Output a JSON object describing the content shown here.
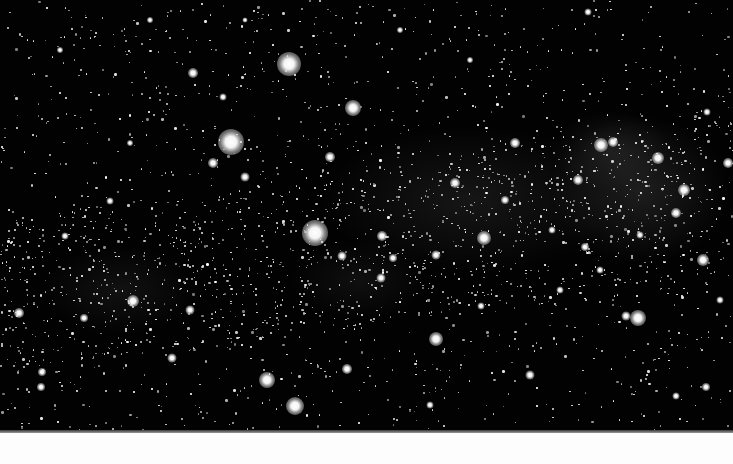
{
  "image": {
    "subject": "Milky Way starfield",
    "background_color": "#020202",
    "bottom_strip_color": "#fdfdfd"
  },
  "haze": [
    {
      "x": 470,
      "y": 200,
      "w": 300,
      "h": 150,
      "alpha": 0.1
    },
    {
      "x": 640,
      "y": 190,
      "w": 180,
      "h": 150,
      "alpha": 0.14
    },
    {
      "x": 610,
      "y": 150,
      "w": 120,
      "h": 80,
      "alpha": 0.1
    },
    {
      "x": 120,
      "y": 290,
      "w": 160,
      "h": 90,
      "alpha": 0.08
    },
    {
      "x": 360,
      "y": 280,
      "w": 140,
      "h": 80,
      "alpha": 0.07
    }
  ],
  "bright_stars": [
    {
      "x": 289,
      "y": 64,
      "r": 24
    },
    {
      "x": 231,
      "y": 142,
      "r": 26
    },
    {
      "x": 315,
      "y": 233,
      "r": 26
    },
    {
      "x": 353,
      "y": 108,
      "r": 16
    },
    {
      "x": 330,
      "y": 157,
      "r": 10
    },
    {
      "x": 193,
      "y": 73,
      "r": 10
    },
    {
      "x": 213,
      "y": 163,
      "r": 10
    },
    {
      "x": 245,
      "y": 177,
      "r": 9
    },
    {
      "x": 223,
      "y": 97,
      "r": 7
    },
    {
      "x": 267,
      "y": 380,
      "r": 16
    },
    {
      "x": 295,
      "y": 406,
      "r": 18
    },
    {
      "x": 436,
      "y": 339,
      "r": 14
    },
    {
      "x": 347,
      "y": 369,
      "r": 10
    },
    {
      "x": 484,
      "y": 238,
      "r": 14
    },
    {
      "x": 455,
      "y": 183,
      "r": 10
    },
    {
      "x": 515,
      "y": 143,
      "r": 10
    },
    {
      "x": 382,
      "y": 236,
      "r": 10
    },
    {
      "x": 393,
      "y": 258,
      "r": 8
    },
    {
      "x": 436,
      "y": 255,
      "r": 9
    },
    {
      "x": 342,
      "y": 256,
      "r": 9
    },
    {
      "x": 381,
      "y": 278,
      "r": 9
    },
    {
      "x": 601,
      "y": 145,
      "r": 14
    },
    {
      "x": 613,
      "y": 142,
      "r": 10
    },
    {
      "x": 658,
      "y": 158,
      "r": 12
    },
    {
      "x": 684,
      "y": 190,
      "r": 12
    },
    {
      "x": 676,
      "y": 213,
      "r": 10
    },
    {
      "x": 703,
      "y": 260,
      "r": 12
    },
    {
      "x": 728,
      "y": 163,
      "r": 10
    },
    {
      "x": 578,
      "y": 180,
      "r": 10
    },
    {
      "x": 638,
      "y": 318,
      "r": 16
    },
    {
      "x": 626,
      "y": 316,
      "r": 9
    },
    {
      "x": 133,
      "y": 301,
      "r": 12
    },
    {
      "x": 19,
      "y": 313,
      "r": 10
    },
    {
      "x": 84,
      "y": 318,
      "r": 8
    },
    {
      "x": 190,
      "y": 310,
      "r": 9
    },
    {
      "x": 172,
      "y": 358,
      "r": 9
    },
    {
      "x": 42,
      "y": 372,
      "r": 8
    },
    {
      "x": 41,
      "y": 387,
      "r": 8
    },
    {
      "x": 65,
      "y": 236,
      "r": 7
    },
    {
      "x": 130,
      "y": 143,
      "r": 6
    },
    {
      "x": 588,
      "y": 12,
      "r": 7
    },
    {
      "x": 585,
      "y": 247,
      "r": 8
    },
    {
      "x": 530,
      "y": 375,
      "r": 9
    },
    {
      "x": 706,
      "y": 387,
      "r": 8
    },
    {
      "x": 707,
      "y": 112,
      "r": 7
    },
    {
      "x": 676,
      "y": 396,
      "r": 7
    },
    {
      "x": 481,
      "y": 306,
      "r": 7
    },
    {
      "x": 560,
      "y": 290,
      "r": 7
    },
    {
      "x": 430,
      "y": 405,
      "r": 7
    },
    {
      "x": 110,
      "y": 201,
      "r": 7
    },
    {
      "x": 60,
      "y": 50,
      "r": 6
    },
    {
      "x": 400,
      "y": 30,
      "r": 6
    },
    {
      "x": 470,
      "y": 60,
      "r": 6
    },
    {
      "x": 150,
      "y": 20,
      "r": 6
    },
    {
      "x": 245,
      "y": 20,
      "r": 5
    },
    {
      "x": 505,
      "y": 200,
      "r": 8
    },
    {
      "x": 552,
      "y": 230,
      "r": 7
    },
    {
      "x": 640,
      "y": 235,
      "r": 7
    },
    {
      "x": 600,
      "y": 270,
      "r": 7
    },
    {
      "x": 720,
      "y": 300,
      "r": 7
    }
  ],
  "faint_star_seed": 7,
  "faint_star_count": 2600
}
